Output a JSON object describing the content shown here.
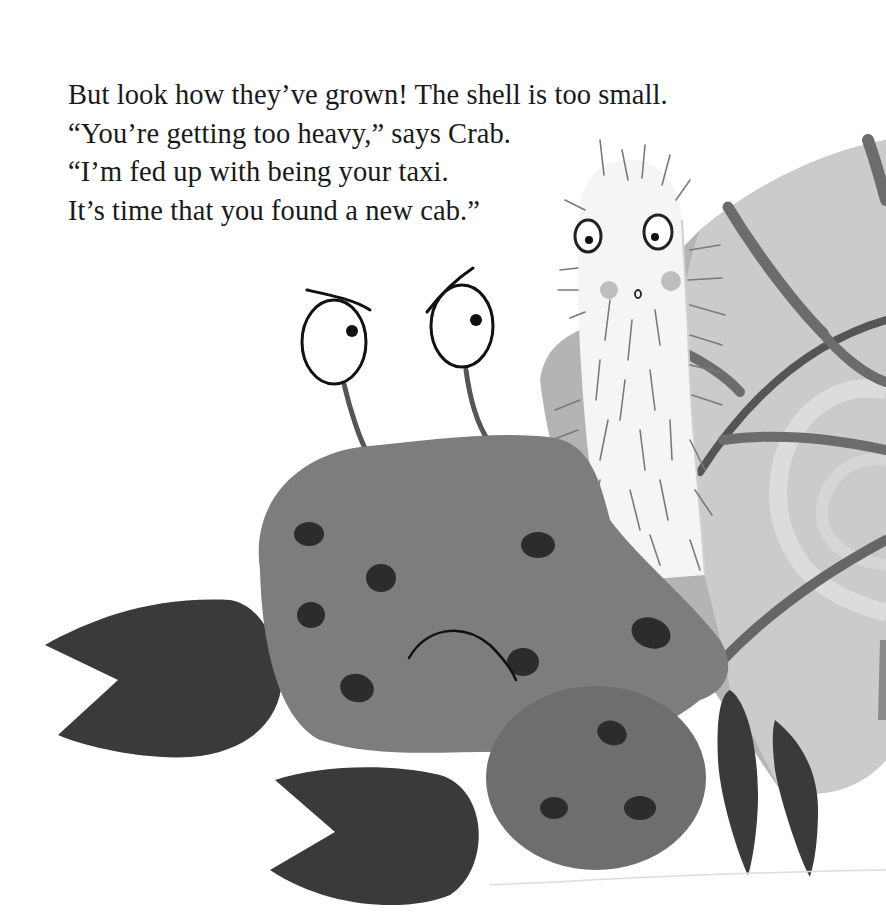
{
  "page": {
    "text_lines": [
      "But look how they’ve grown! The shell is too small.",
      "“You’re getting too heavy,” says Crab.",
      "“I’m fed up with being your taxi.",
      "It’s time that you found a new cab.”"
    ]
  },
  "illustration": {
    "characters": [
      "crab",
      "hairy-creature",
      "snail-shell"
    ],
    "colors": {
      "background": "#ffffff",
      "crab_body": "#7e7e7e",
      "crab_spots": "#2e2e2e",
      "crab_claws": "#3c3c3c",
      "claw_small_body": "#6e6e6e",
      "shell_light": "#c8c8c8",
      "shell_mid": "#a8a8a8",
      "shell_stripes": "#6a6a6a",
      "creature_body": "#f4f4f4",
      "creature_hair": "#7a7a7a",
      "ink": "#111111"
    }
  }
}
